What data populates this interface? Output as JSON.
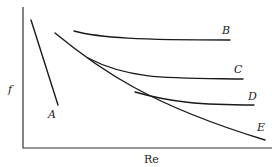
{
  "figure": {
    "x_axis_label": "Re",
    "y_axis_label": "f",
    "curves": [
      {
        "id": "A",
        "label": "A"
      },
      {
        "id": "B",
        "label": "B"
      },
      {
        "id": "C",
        "label": "C"
      },
      {
        "id": "D",
        "label": "D"
      },
      {
        "id": "E",
        "label": "E"
      }
    ],
    "colors": {
      "line": "#1a1a1a",
      "axis": "#333333",
      "background": "#ffffff"
    }
  }
}
